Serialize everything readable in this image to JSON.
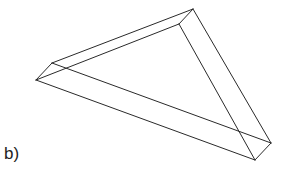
{
  "figure": {
    "label": "b)",
    "stroke_color": "#2a2a2a",
    "lines": [
      {
        "x1": 36,
        "y1": 80,
        "x2": 52,
        "y2": 63
      },
      {
        "x1": 52,
        "y1": 63,
        "x2": 193,
        "y2": 9
      },
      {
        "x1": 36,
        "y1": 80,
        "x2": 179,
        "y2": 24
      },
      {
        "x1": 193,
        "y1": 9,
        "x2": 179,
        "y2": 24
      },
      {
        "x1": 193,
        "y1": 9,
        "x2": 271,
        "y2": 143
      },
      {
        "x1": 179,
        "y1": 24,
        "x2": 255,
        "y2": 160
      },
      {
        "x1": 271,
        "y1": 143,
        "x2": 255,
        "y2": 160
      },
      {
        "x1": 36,
        "y1": 80,
        "x2": 255,
        "y2": 160
      },
      {
        "x1": 52,
        "y1": 63,
        "x2": 271,
        "y2": 143
      }
    ]
  }
}
